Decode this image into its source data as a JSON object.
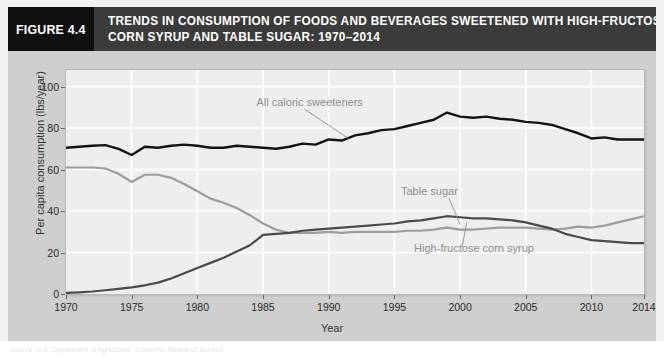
{
  "figure": {
    "number_label": "FIGURE 4.4",
    "title_line_1": "TRENDS IN CONSUMPTION OF FOODS AND BEVERAGES SWEETENED WITH HIGH-FRUCTOSE",
    "title_line_2": "CORN SYRUP AND TABLE SUGAR: 1970–2014"
  },
  "colors": {
    "header_bar": "#3b3b3b",
    "figure_number_block": "#101010",
    "mat": "#cfcfcd",
    "plot_background": "#eeeeec",
    "gridline": "#ffffff",
    "all_caloric_sweeteners": "#141414",
    "table_sugar": "#9d9d9b",
    "high_fructose_corn_syrup": "#4a4a4a",
    "label_text": "#8e8e8c"
  },
  "chart_data": {
    "type": "line",
    "title": "Trends in consumption of foods and beverages sweetened with high-fructose corn syrup and table sugar: 1970–2014",
    "xlabel": "Year",
    "ylabel": "Per capita consumption (lbs/year)",
    "xlim": [
      1970,
      2014
    ],
    "ylim": [
      0,
      108
    ],
    "grid": true,
    "legend_position": "inline-annotations",
    "y_ticks": [
      0,
      20,
      40,
      60,
      80,
      100
    ],
    "x_ticks": [
      1970,
      1975,
      1980,
      1985,
      1990,
      1995,
      2000,
      2005,
      2010,
      2014
    ],
    "x": [
      1970,
      1971,
      1972,
      1973,
      1974,
      1975,
      1976,
      1977,
      1978,
      1979,
      1980,
      1981,
      1982,
      1983,
      1984,
      1985,
      1986,
      1987,
      1988,
      1989,
      1990,
      1991,
      1992,
      1993,
      1994,
      1995,
      1996,
      1997,
      1998,
      1999,
      2000,
      2001,
      2002,
      2003,
      2004,
      2005,
      2006,
      2007,
      2008,
      2009,
      2010,
      2011,
      2012,
      2013,
      2014
    ],
    "series": [
      {
        "name": "All caloric sweeteners",
        "color": "#141414",
        "width": 2.4,
        "values": [
          70.5,
          71.0,
          71.5,
          71.8,
          70.0,
          67.0,
          71.0,
          70.5,
          71.5,
          72.0,
          71.5,
          70.5,
          70.5,
          71.5,
          71.0,
          70.5,
          70.0,
          71.0,
          72.5,
          72.0,
          74.5,
          74.0,
          76.5,
          77.5,
          79.0,
          79.5,
          81.0,
          82.5,
          84.0,
          87.5,
          85.5,
          85.0,
          85.5,
          84.5,
          84.0,
          83.0,
          82.5,
          81.5,
          79.5,
          77.5,
          75.0,
          75.5,
          74.5,
          74.5,
          74.5
        ]
      },
      {
        "name": "Table sugar",
        "color": "#9d9d9b",
        "width": 2.2,
        "values": [
          61.0,
          61.0,
          61.0,
          60.5,
          58.0,
          54.0,
          57.5,
          57.5,
          56.0,
          53.0,
          49.5,
          46.0,
          44.0,
          41.5,
          38.0,
          34.0,
          31.0,
          29.5,
          29.5,
          29.5,
          30.0,
          29.5,
          30.0,
          30.0,
          30.0,
          30.0,
          30.5,
          30.5,
          31.0,
          32.0,
          31.0,
          31.0,
          31.5,
          32.0,
          32.0,
          32.0,
          31.5,
          31.0,
          31.5,
          32.5,
          32.0,
          33.0,
          34.5,
          36.0,
          37.5
        ]
      },
      {
        "name": "High-fructose corn syrup",
        "color": "#4a4a4a",
        "width": 2.2,
        "values": [
          0.5,
          1.0,
          1.5,
          2.5,
          3.5,
          5.0,
          6.5,
          8.5,
          11.0,
          14.5,
          19.0,
          23.0,
          26.5,
          30.5,
          35.0,
          44.5,
          45.0,
          46.5,
          47.0,
          47.0,
          49.5,
          50.0,
          51.5,
          53.5,
          55.0,
          56.0,
          57.5,
          59.0,
          60.5,
          63.0,
          62.5,
          62.0,
          62.5,
          61.5,
          60.5,
          59.0,
          56.5,
          54.0,
          50.5,
          48.5,
          47.0,
          45.0,
          44.5,
          44.0,
          44.0
        ],
        "_note_values_scaled": "rendered pixel series below uses corrected lbs/year readings"
      }
    ],
    "series_values_lbs": {
      "all_caloric_sweeteners": [
        70.5,
        71.0,
        71.5,
        71.8,
        70.0,
        67.0,
        71.0,
        70.5,
        71.5,
        72.0,
        71.5,
        70.5,
        70.5,
        71.5,
        71.0,
        70.5,
        70.0,
        71.0,
        72.5,
        72.0,
        74.5,
        74.0,
        76.5,
        77.5,
        79.0,
        79.5,
        81.0,
        82.5,
        84.0,
        87.5,
        85.5,
        85.0,
        85.5,
        84.5,
        84.0,
        83.0,
        82.5,
        81.5,
        79.5,
        77.5,
        75.0,
        75.5,
        74.5,
        74.5,
        74.5
      ],
      "table_sugar": [
        61.0,
        61.0,
        61.0,
        60.5,
        58.0,
        54.0,
        57.5,
        57.5,
        56.0,
        53.0,
        49.5,
        46.0,
        44.0,
        41.5,
        38.0,
        34.0,
        31.0,
        29.5,
        29.5,
        29.5,
        30.0,
        29.5,
        30.0,
        30.0,
        30.0,
        30.0,
        30.5,
        30.5,
        31.0,
        32.0,
        31.0,
        31.0,
        31.5,
        32.0,
        32.0,
        32.0,
        31.5,
        31.0,
        31.5,
        32.5,
        32.0,
        33.0,
        34.5,
        36.0,
        37.5
      ],
      "high_fructose_corn_syrup": [
        0.5,
        0.8,
        1.2,
        1.8,
        2.5,
        3.2,
        4.2,
        5.5,
        7.5,
        10.0,
        12.5,
        15.0,
        17.5,
        20.5,
        23.5,
        28.5,
        29.0,
        29.5,
        30.5,
        31.0,
        31.5,
        32.0,
        32.5,
        33.0,
        33.5,
        34.0,
        35.0,
        35.5,
        36.5,
        37.5,
        37.0,
        36.5,
        36.5,
        36.0,
        35.5,
        34.5,
        33.0,
        31.5,
        29.0,
        27.5,
        26.0,
        25.5,
        25.0,
        24.5,
        24.5
      ]
    },
    "annotations": [
      {
        "text": "All caloric sweeteners",
        "x_label": 1984.5,
        "y_label": 92.0,
        "target_x": 1991.5,
        "target_y": 75.0
      },
      {
        "text": "Table sugar",
        "x_label": 1995.5,
        "y_label": 49.0,
        "target_x": 2000.0,
        "target_y": 33.5
      },
      {
        "text": "High-fructose corn syrup",
        "x_label": 1996.5,
        "y_label": 21.5,
        "target_x": 2000.5,
        "target_y": 34.5
      }
    ]
  },
  "source": {
    "text": "Source: U.S. Department of Agriculture, Economic Research Service."
  }
}
